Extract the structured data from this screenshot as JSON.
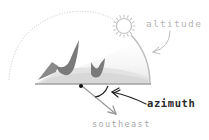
{
  "diagram": {
    "labels": {
      "altitude": "altitude",
      "azimuth": "azimuth",
      "southeast": "southeast"
    },
    "icons": {
      "sun": "sun-icon",
      "mountains": "mountains-icon"
    },
    "colors": {
      "dotted_arc": "#c8c8c8",
      "solid_arc": "#bdbdbd",
      "dome_fill": "#dcdcdc",
      "mountain": "#7a7a7a",
      "horizon": "#a0a0a0",
      "observer_dot": "#111111",
      "azimuth_arrow": "#222222",
      "southeast_arrow": "#9a9a9a",
      "altitude_text": "#b4b4b4",
      "azimuth_text": "#2a2a2a",
      "southeast_text": "#a8a8a8"
    }
  }
}
